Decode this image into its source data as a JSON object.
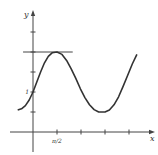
{
  "chart_data": {
    "type": "line",
    "title": "",
    "xlabel": "x",
    "ylabel": "y",
    "x_ticks": [
      {
        "value": 1.5708,
        "label": "π/2"
      },
      {
        "value": 3.1416,
        "label": ""
      },
      {
        "value": 4.7124,
        "label": ""
      },
      {
        "value": 6.2832,
        "label": ""
      }
    ],
    "y_ticks": [
      {
        "value": 0.5,
        "label": ""
      },
      {
        "value": 1.0,
        "label": "1"
      },
      {
        "value": 1.5,
        "label": ""
      },
      {
        "value": 2.0,
        "label": ""
      },
      {
        "value": 2.5,
        "label": ""
      }
    ],
    "xlim": [
      -1.0,
      6.9
    ],
    "ylim": [
      -0.55,
      2.9
    ],
    "grid": false,
    "legend": null,
    "series": [
      {
        "name": "curve",
        "x": [
          -1.0,
          -0.75,
          -0.5,
          -0.25,
          0.0,
          0.25,
          0.5,
          0.75,
          1.0,
          1.25,
          1.5708,
          1.9,
          2.2,
          2.5,
          2.8,
          3.1,
          3.4,
          3.7,
          4.0,
          4.3,
          4.7124,
          5.0,
          5.3,
          5.6,
          5.9,
          6.2,
          6.5,
          6.8
        ],
        "y": [
          0.55,
          0.58,
          0.66,
          0.8,
          1.0,
          1.25,
          1.5,
          1.73,
          1.89,
          1.98,
          2.0,
          1.94,
          1.79,
          1.58,
          1.34,
          1.08,
          0.86,
          0.68,
          0.56,
          0.5,
          0.5,
          0.55,
          0.68,
          0.88,
          1.14,
          1.42,
          1.7,
          1.94
        ]
      }
    ],
    "annotations": [
      {
        "type": "hline",
        "y": 2.0,
        "x_from": -0.65,
        "x_to": 2.6,
        "label": "tangent line at maximum"
      }
    ]
  }
}
